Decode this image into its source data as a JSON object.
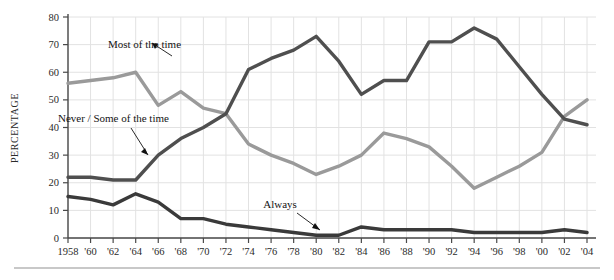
{
  "chart_data": {
    "type": "line",
    "title": "",
    "xlabel": "",
    "ylabel": "PERCENTAGE",
    "ylim": [
      0,
      80
    ],
    "ytick_step": 10,
    "yticks": [
      "0",
      "10",
      "20",
      "30",
      "40",
      "50",
      "60",
      "70",
      "80"
    ],
    "grid": true,
    "legend_position": "inline-annotations",
    "x": [
      1958,
      1960,
      1962,
      1964,
      1966,
      1968,
      1970,
      1972,
      1974,
      1976,
      1978,
      1980,
      1982,
      1984,
      1986,
      1988,
      1990,
      1992,
      1994,
      1996,
      1998,
      2000,
      2002,
      2004
    ],
    "categories": [
      "1958",
      "'60",
      "'62",
      "'64",
      "'66",
      "'68",
      "'70",
      "'72",
      "'74",
      "'76",
      "'78",
      "'80",
      "'82",
      "'84",
      "'86",
      "'88",
      "'90",
      "'92",
      "'94",
      "'96",
      "'98",
      "'00",
      "'02",
      "'04"
    ],
    "series": [
      {
        "name": "Most of the time",
        "color": "#9a9a9a",
        "label_text": "Most of the time",
        "values": [
          56,
          57,
          58,
          60,
          48,
          53,
          47,
          45,
          34,
          30,
          27,
          23,
          26,
          30,
          38,
          36,
          33,
          26,
          18,
          22,
          26,
          31,
          44,
          50
        ]
      },
      {
        "name": "Never/Some of the time",
        "color": "#4f4f4f",
        "label_text": "Never / Some of the time",
        "values": [
          22,
          22,
          21,
          21,
          30,
          36,
          40,
          45,
          61,
          65,
          68,
          73,
          64,
          52,
          57,
          57,
          71,
          71,
          76,
          72,
          62,
          52,
          43,
          41
        ]
      },
      {
        "name": "Always",
        "color": "#3a3a3a",
        "label_text": "Always",
        "values": [
          15,
          14,
          12,
          16,
          13,
          7,
          7,
          5,
          4,
          3,
          2,
          1,
          1,
          4,
          3,
          3,
          3,
          3,
          2,
          2,
          2,
          2,
          3,
          2
        ]
      }
    ],
    "annotations": [
      {
        "text": "Most of the time",
        "series": "Most of the time",
        "points_to_year": 1964
      },
      {
        "text": "Never / Some of the time",
        "series": "Never/Some of the time",
        "points_to_year": 1966
      },
      {
        "text": "Always",
        "series": "Always",
        "points_to_year": 1980
      }
    ]
  }
}
